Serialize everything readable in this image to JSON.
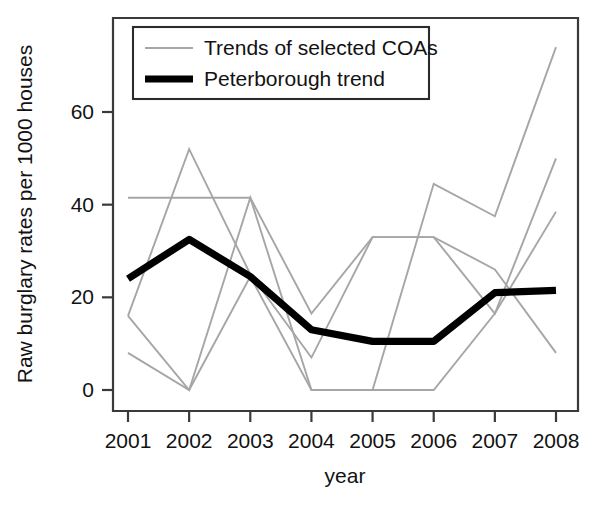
{
  "chart_data": {
    "type": "line",
    "title": "",
    "xlabel": "year",
    "ylabel": "Raw burglary rates per 1000 houses",
    "x": [
      2001,
      2002,
      2003,
      2004,
      2005,
      2006,
      2007,
      2008
    ],
    "xtick_labels": [
      "2001",
      "2002",
      "2003",
      "2004",
      "2005",
      "2006",
      "2007",
      "2008"
    ],
    "ytick_labels": [
      "0",
      "20",
      "40",
      "60"
    ],
    "yticks": [
      0,
      20,
      40,
      60
    ],
    "xlim": [
      2000.7,
      2008.3
    ],
    "ylim": [
      -3,
      77
    ],
    "grid": false,
    "legend_position": "top-left",
    "series": [
      {
        "name": "Trends of selected COAs",
        "color": "#a6a6a6",
        "width": "thin",
        "values": [
          16.0,
          52.0,
          25.0,
          7.0,
          33.0,
          33.0,
          26.0,
          8.0
        ]
      },
      {
        "name": "Trends of selected COAs",
        "color": "#a6a6a6",
        "width": "thin",
        "values": [
          8.0,
          0.0,
          41.5,
          0.0,
          0.0,
          44.5,
          37.5,
          74.0
        ]
      },
      {
        "name": "Trends of selected COAs",
        "color": "#a6a6a6",
        "width": "thin",
        "values": [
          41.5,
          41.5,
          41.5,
          16.5,
          33.0,
          33.0,
          16.5,
          50.0
        ]
      },
      {
        "name": "Trends of selected COAs",
        "color": "#a6a6a6",
        "width": "thin",
        "values": [
          16.0,
          0.0,
          24.5,
          0.0,
          0.0,
          0.0,
          16.5,
          38.5
        ]
      },
      {
        "name": "Peterborough trend",
        "color": "#000000",
        "width": "thick",
        "values": [
          24.0,
          32.5,
          24.5,
          13.0,
          10.5,
          10.5,
          21.0,
          21.5
        ]
      }
    ]
  },
  "legend": {
    "entries": [
      {
        "label": "Trends of selected COAs",
        "style": "thin",
        "color": "#a6a6a6"
      },
      {
        "label": "Peterborough trend",
        "style": "thick",
        "color": "#000000"
      }
    ]
  },
  "axes": {
    "x_title": "year",
    "y_title": "Raw burglary rates per 1000 houses"
  }
}
